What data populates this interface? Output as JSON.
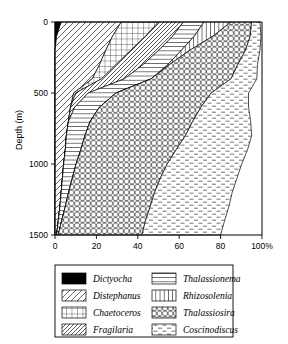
{
  "chart_data": {
    "type": "area",
    "title": "",
    "xlabel": "",
    "ylabel": "Depth (m)",
    "xlim": [
      0,
      100
    ],
    "ylim": [
      0,
      1500
    ],
    "y_inverted": true,
    "grid": false,
    "legend_position": "below",
    "xticks": [
      "0",
      "20",
      "40",
      "60",
      "80",
      "100%"
    ],
    "xtick_values": [
      0,
      20,
      40,
      60,
      80,
      100
    ],
    "yticks": [
      "0",
      "500",
      "1000",
      "1500"
    ],
    "ytick_values": [
      0,
      500,
      1000,
      1500
    ],
    "stacking": "cumulative_percent",
    "depths": [
      0,
      100,
      200,
      300,
      400,
      500,
      600,
      700,
      800,
      900,
      1000,
      1100,
      1200,
      1300,
      1400,
      1500
    ],
    "series": [
      {
        "name": "Dictyocha",
        "pattern": "solid-black",
        "values": [
          3.0,
          0.8,
          0.0,
          0.0,
          0.0,
          0.0,
          0.0,
          0.0,
          0.0,
          0.0,
          0.0,
          0.0,
          0.0,
          0.0,
          0.0,
          0.0
        ]
      },
      {
        "name": "Distephanus",
        "pattern": "backslash-sparse",
        "values": [
          29.0,
          27.0,
          24.5,
          21.5,
          18.0,
          9.0,
          7.5,
          6.5,
          5.5,
          5.0,
          4.2,
          3.6,
          3.0,
          2.4,
          1.6,
          0.8
        ]
      },
      {
        "name": "Chaetoceros",
        "pattern": "grid",
        "values": [
          18.0,
          16.0,
          12.0,
          8.0,
          4.5,
          1.0,
          0.0,
          0.0,
          0.0,
          0.0,
          0.0,
          0.0,
          0.0,
          0.0,
          0.0,
          0.0
        ]
      },
      {
        "name": "Fragilaria",
        "pattern": "slash-dense",
        "values": [
          12.0,
          13.0,
          13.5,
          13.0,
          11.0,
          6.0,
          2.0,
          0.0,
          0.0,
          0.0,
          0.0,
          0.0,
          0.0,
          0.0,
          0.0,
          0.0
        ]
      },
      {
        "name": "Thalassionema",
        "pattern": "horizontal",
        "values": [
          10.0,
          10.5,
          11.0,
          12.0,
          13.0,
          13.5,
          12.0,
          10.5,
          9.0,
          7.5,
          6.0,
          4.8,
          3.6,
          2.6,
          1.6,
          0.8
        ]
      },
      {
        "name": "Rhizosolenia",
        "pattern": "vertical",
        "values": [
          13.0,
          9.0,
          4.0,
          0.8,
          0.0,
          0.0,
          0.0,
          0.0,
          0.0,
          0.0,
          0.0,
          0.0,
          0.0,
          0.0,
          0.0,
          0.0
        ]
      },
      {
        "name": "Thalassiosira",
        "pattern": "xmesh",
        "values": [
          10.0,
          18.0,
          27.0,
          33.0,
          38.5,
          46.0,
          49.0,
          49.5,
          48.5,
          46.0,
          44.0,
          42.5,
          41.5,
          41.0,
          40.5,
          40.4
        ]
      },
      {
        "name": "Coscinodiscus",
        "pattern": "dash-sparse",
        "values": [
          4.0,
          5.2,
          7.0,
          9.5,
          12.5,
          18.0,
          23.0,
          28.0,
          32.0,
          34.5,
          36.0,
          37.0,
          37.5,
          38.0,
          38.2,
          38.0
        ]
      }
    ]
  },
  "legend": {
    "columns": [
      [
        {
          "label": "Dictyocha",
          "pattern": "solid-black"
        },
        {
          "label": "Distephanus",
          "pattern": "backslash-sparse"
        },
        {
          "label": "Chaetoceros",
          "pattern": "grid"
        },
        {
          "label": "Fragilaria",
          "pattern": "slash-dense"
        }
      ],
      [
        {
          "label": "Thalassionema",
          "pattern": "horizontal"
        },
        {
          "label": "Rhizosolenia",
          "pattern": "vertical"
        },
        {
          "label": "Thalassiosira",
          "pattern": "xmesh"
        },
        {
          "label": "Coscinodiscus",
          "pattern": "dash-sparse"
        }
      ]
    ]
  },
  "colors": {
    "ink": "#000000",
    "background": "#ffffff"
  }
}
